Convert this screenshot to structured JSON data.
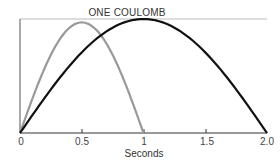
{
  "chart_data": {
    "type": "line",
    "title": "ONE COULOMB",
    "xlabel": "Seconds",
    "ylabel": "",
    "xlim": [
      0,
      2.0
    ],
    "ylim": [
      0,
      1.0
    ],
    "x_ticks": [
      0,
      0.5,
      1,
      1.5,
      2.0
    ],
    "x_tick_labels": [
      "0",
      "0.5",
      "1",
      "1.5",
      "2.0"
    ],
    "grid": false,
    "legend": null,
    "reference_line": {
      "label": "ONE COULOMB",
      "y": 1.0,
      "color": "#bbbbbb"
    },
    "series": [
      {
        "name": "1-second pulse",
        "color": "#999999",
        "shape": "half-sine",
        "x": [
          0,
          0.1,
          0.2,
          0.3,
          0.4,
          0.5,
          0.6,
          0.7,
          0.8,
          0.9,
          1.0
        ],
        "values": [
          0,
          0.3,
          0.57,
          0.78,
          0.92,
          0.97,
          0.92,
          0.78,
          0.57,
          0.3,
          0
        ]
      },
      {
        "name": "2-second pulse",
        "color": "#111111",
        "shape": "half-sine",
        "x": [
          0,
          0.25,
          0.5,
          0.75,
          1.0,
          1.25,
          1.5,
          1.75,
          2.0
        ],
        "values": [
          0,
          0.38,
          0.71,
          0.92,
          1.0,
          0.92,
          0.71,
          0.38,
          0
        ]
      }
    ]
  },
  "labels": {
    "title": "ONE COULOMB",
    "xlabel": "Seconds",
    "ticks": [
      "0",
      "0.5",
      "1",
      "1.5",
      "2.0"
    ]
  }
}
